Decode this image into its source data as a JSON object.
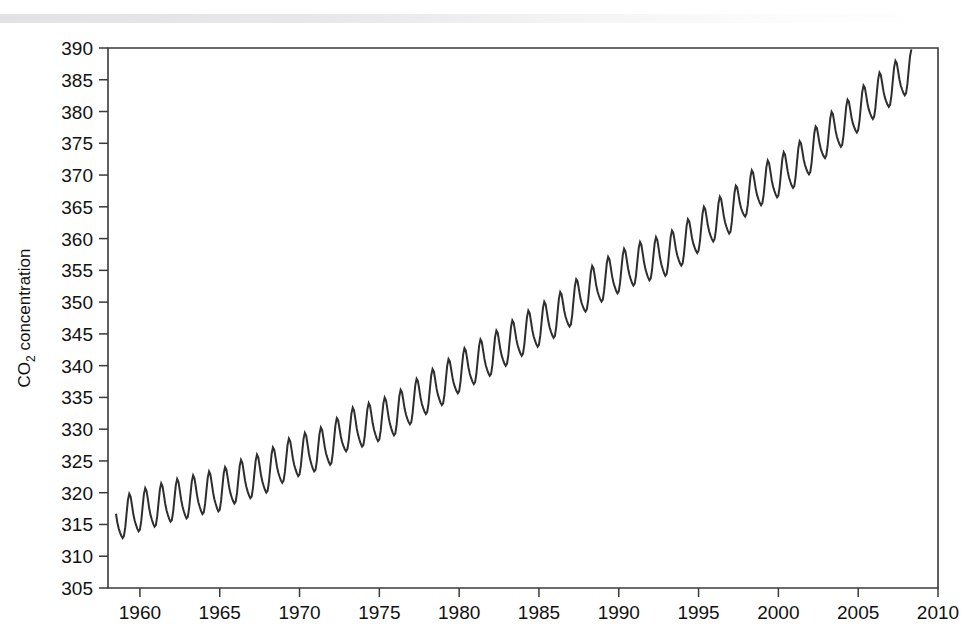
{
  "figure": {
    "background_color": "#ffffff",
    "line_color": "#2e2e2e",
    "axis_color": "#3a3a3a",
    "text_color": "#111111"
  },
  "axis_titles": {
    "y_main": "CO",
    "y_sub": "2",
    "y_rest": " concentration",
    "x": ""
  },
  "chart_data": {
    "type": "line",
    "title": "",
    "xlabel": "",
    "ylabel": "CO2 concentration",
    "xlim": [
      1958,
      2010
    ],
    "ylim": [
      305,
      390
    ],
    "grid": false,
    "legend": null,
    "x_ticks": [
      1960,
      1965,
      1970,
      1975,
      1980,
      1985,
      1990,
      1995,
      2000,
      2005,
      2010
    ],
    "x_tick_labels": [
      "1960",
      "1965",
      "1970",
      "1975",
      "1980",
      "1985",
      "1990",
      "1995",
      "2000",
      "2005",
      "2010"
    ],
    "y_ticks": [
      305,
      310,
      315,
      320,
      325,
      330,
      335,
      340,
      345,
      350,
      355,
      360,
      365,
      370,
      375,
      380,
      385,
      390
    ],
    "y_tick_labels": [
      "305",
      "310",
      "315",
      "320",
      "325",
      "330",
      "335",
      "340",
      "345",
      "350",
      "355",
      "360",
      "365",
      "370",
      "375",
      "380",
      "385",
      "390"
    ],
    "series": [
      {
        "name": "Mauna Loa monthly mean CO2",
        "x_start": 1958.5,
        "x_end": 2008.4,
        "annual_trend": [
          {
            "year": 1958.5,
            "mean": 315.0
          },
          {
            "year": 1959,
            "mean": 315.9
          },
          {
            "year": 1960,
            "mean": 316.9
          },
          {
            "year": 1961,
            "mean": 317.6
          },
          {
            "year": 1962,
            "mean": 318.4
          },
          {
            "year": 1963,
            "mean": 318.9
          },
          {
            "year": 1964,
            "mean": 319.6
          },
          {
            "year": 1965,
            "mean": 320.0
          },
          {
            "year": 1966,
            "mean": 321.3
          },
          {
            "year": 1967,
            "mean": 322.1
          },
          {
            "year": 1968,
            "mean": 323.0
          },
          {
            "year": 1969,
            "mean": 324.6
          },
          {
            "year": 1970,
            "mean": 325.6
          },
          {
            "year": 1971,
            "mean": 326.3
          },
          {
            "year": 1972,
            "mean": 327.4
          },
          {
            "year": 1973,
            "mean": 329.6
          },
          {
            "year": 1974,
            "mean": 330.2
          },
          {
            "year": 1975,
            "mean": 331.1
          },
          {
            "year": 1976,
            "mean": 332.0
          },
          {
            "year": 1977,
            "mean": 333.8
          },
          {
            "year": 1978,
            "mean": 335.4
          },
          {
            "year": 1979,
            "mean": 336.8
          },
          {
            "year": 1980,
            "mean": 338.7
          },
          {
            "year": 1981,
            "mean": 340.1
          },
          {
            "year": 1982,
            "mean": 341.4
          },
          {
            "year": 1983,
            "mean": 343.0
          },
          {
            "year": 1984,
            "mean": 344.6
          },
          {
            "year": 1985,
            "mean": 346.0
          },
          {
            "year": 1986,
            "mean": 347.4
          },
          {
            "year": 1987,
            "mean": 349.2
          },
          {
            "year": 1988,
            "mean": 351.6
          },
          {
            "year": 1989,
            "mean": 353.1
          },
          {
            "year": 1990,
            "mean": 354.4
          },
          {
            "year": 1991,
            "mean": 355.6
          },
          {
            "year": 1992,
            "mean": 356.4
          },
          {
            "year": 1993,
            "mean": 357.1
          },
          {
            "year": 1994,
            "mean": 358.8
          },
          {
            "year": 1995,
            "mean": 360.8
          },
          {
            "year": 1996,
            "mean": 362.6
          },
          {
            "year": 1997,
            "mean": 363.8
          },
          {
            "year": 1998,
            "mean": 366.6
          },
          {
            "year": 1999,
            "mean": 368.3
          },
          {
            "year": 2000,
            "mean": 369.5
          },
          {
            "year": 2001,
            "mean": 371.0
          },
          {
            "year": 2002,
            "mean": 373.2
          },
          {
            "year": 2003,
            "mean": 375.8
          },
          {
            "year": 2004,
            "mean": 377.5
          },
          {
            "year": 2005,
            "mean": 379.8
          },
          {
            "year": 2006,
            "mean": 381.9
          },
          {
            "year": 2007,
            "mean": 383.8
          },
          {
            "year": 2008,
            "mean": 385.6
          },
          {
            "year": 2008.4,
            "mean": 386.3
          }
        ],
        "seasonal_amplitude_ppm": 6.2,
        "seasonal_peak_month": 5,
        "notes": "Monthly sawtooth: maximum in May, minimum in late September/October"
      }
    ]
  }
}
